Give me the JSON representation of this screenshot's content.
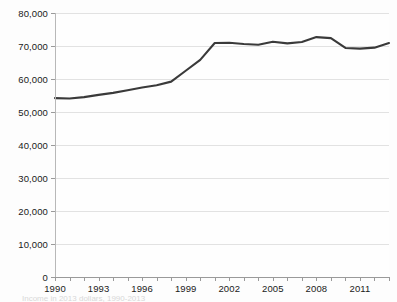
{
  "chart_data": {
    "type": "line",
    "title": "",
    "subtitle": "",
    "xlabel": "",
    "ylabel": "",
    "grid": "horizontal",
    "legend": "none",
    "xlim": [
      1990,
      2013
    ],
    "ylim": [
      0,
      80000
    ],
    "ytick_values": [
      0,
      10000,
      20000,
      30000,
      40000,
      50000,
      60000,
      70000,
      80000
    ],
    "ytick_labels": [
      "0",
      "10,000",
      "20,000",
      "30,000",
      "40,000",
      "50,000",
      "60,000",
      "70,000",
      "80,000"
    ],
    "xtick_values": [
      1990,
      1993,
      1996,
      1999,
      2002,
      2005,
      2008,
      2011
    ],
    "xtick_labels": [
      "1990",
      "1993",
      "1996",
      "1999",
      "2002",
      "2005",
      "2008",
      "2011"
    ],
    "x": [
      1990,
      1991,
      1992,
      1993,
      1994,
      1995,
      1996,
      1997,
      1998,
      1999,
      2000,
      2001,
      2002,
      2003,
      2004,
      2005,
      2006,
      2007,
      2008,
      2009,
      2010,
      2011,
      2012,
      2013
    ],
    "series": [
      {
        "name": "Median household income",
        "color": "#3a3a3a",
        "values": [
          54200,
          54100,
          54500,
          55200,
          55800,
          56600,
          57400,
          58100,
          59200,
          62500,
          65800,
          70900,
          71000,
          70600,
          70400,
          71300,
          70800,
          71200,
          72700,
          72400,
          69400,
          69200,
          69500,
          70900
        ]
      }
    ],
    "annotations": []
  },
  "caption": {
    "text": "Income in 2013 dollars, 1990-2013"
  },
  "style": {
    "line_color": "#3a3a3a",
    "grid_color": "#e2e2e2",
    "axis_color": "#9a9a9a",
    "background": "#fdfdfd",
    "text_color": "#1a1a1a"
  }
}
